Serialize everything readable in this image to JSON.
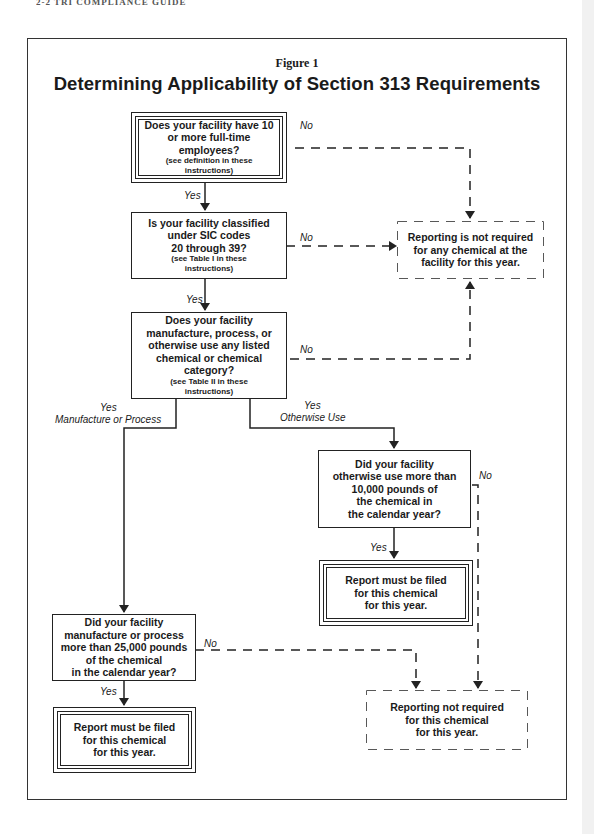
{
  "page": {
    "running_head": "2-2    TRI COMPLIANCE GUIDE"
  },
  "figure": {
    "label": "Figure 1",
    "title": "Determining Applicability of Section 313 Requirements"
  },
  "nodes": {
    "employees": {
      "lines": [
        "Does your facility have 10",
        "or more full-time",
        "employees?"
      ],
      "note": [
        "(see definition in these",
        "instructions)"
      ]
    },
    "sic_codes": {
      "lines": [
        "Is your facility classified",
        "under SIC codes",
        "20 through 39?"
      ],
      "note": [
        "(see Table I in these",
        "instructions)"
      ]
    },
    "listed_chemical": {
      "lines": [
        "Does your facility",
        "manufacture, process, or",
        "otherwise use any listed",
        "chemical or chemical",
        "category?"
      ],
      "note": [
        "(see Table II in these",
        "instructions)"
      ]
    },
    "not_required_any": {
      "lines": [
        "Reporting is not required",
        "for any chemical at the",
        "facility for this year."
      ]
    },
    "otherwise_use_threshold": {
      "lines": [
        "Did your facility",
        "otherwise use more than",
        "10,000 pounds of",
        "the chemical in",
        "the calendar year?"
      ]
    },
    "report_filed_otherwise": {
      "lines": [
        "Report must be filed",
        "for this chemical",
        "for this year."
      ]
    },
    "manufacture_threshold": {
      "lines": [
        "Did your facility",
        "manufacture or process",
        "more than 25,000 pounds",
        "of the chemical",
        "in the calendar year?"
      ]
    },
    "report_filed_manufacture": {
      "lines": [
        "Report must be filed",
        "for this chemical",
        "for this year."
      ]
    },
    "not_required_chemical": {
      "lines": [
        "Reporting not required",
        "for this chemical",
        "for this year."
      ]
    }
  },
  "edge_labels": {
    "yes1": "Yes",
    "yes2": "Yes",
    "no1": "No",
    "no2": "No",
    "no3": "No",
    "yes_manufacture_1": "Yes",
    "yes_manufacture_2": "Manufacture or Process",
    "yes_otherwise_1": "Yes",
    "yes_otherwise_2": "Otherwise Use",
    "no4": "No",
    "yes3": "Yes",
    "no5": "No",
    "yes4": "Yes"
  },
  "colors": {
    "line": "#222222",
    "background": "#ffffff"
  }
}
